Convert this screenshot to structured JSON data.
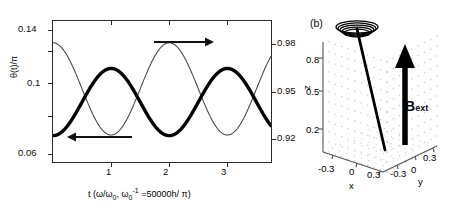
{
  "figure": {
    "panel_a_tag": "(a)",
    "panel_b_tag": "(b)"
  },
  "panel_a": {
    "ylabel_left": "θ(t)/π",
    "xlabel": "t (ω/ω₀, ω₀⁻¹ =50000h/ π)",
    "xlabel_main": "t (",
    "xlabel_w": "ω/ω",
    "xlabel_w_sub": "0",
    "xlabel_comma": ", ",
    "xlabel_w2": "ω",
    "xlabel_w2_sub": "0",
    "xlabel_w2_sup": "-1",
    "xlabel_tail": " =50000h/ π)",
    "annotation_cos": "cosθ(t)",
    "left_ticks": [
      "0.14",
      "0.1",
      "0.06"
    ],
    "right_ticks": [
      "0.98",
      "0.95",
      "0.92"
    ],
    "x_ticks": [
      "1",
      "2",
      "3"
    ],
    "arrow_left_name": "left-arrow-to-theta-axis",
    "arrow_right_name": "right-arrow-to-cos-axis"
  },
  "panel_b": {
    "xlabel": "x",
    "ylabel": "y",
    "zlabel": "z",
    "x_ticks": [
      "-0.3",
      "0",
      "0.3"
    ],
    "y_ticks": [
      "-0.3",
      "0",
      "0.3"
    ],
    "z_ticks": [
      "0.8",
      "0.5",
      "0.2"
    ],
    "field_label": "B",
    "field_sub": "ext"
  },
  "colors": {
    "axis": "#2b2b2b",
    "theta_curve": "#000000",
    "cos_curve": "#4a4a4a",
    "grid_dots": "#b9b9b9",
    "background": "#ffffff"
  },
  "chart_data": [
    {
      "type": "line",
      "title": "(a)",
      "xlabel": "t (ω/ω₀, ω₀⁻¹ =50000h/π)",
      "ylabel": "θ(t)/π",
      "ylabel_right": "cosθ(t)",
      "xlim": [
        0,
        3.75
      ],
      "ylim": [
        0.045,
        0.152
      ],
      "ylim_right": [
        0.9095,
        0.9905
      ],
      "xticks": [
        1,
        2,
        3
      ],
      "yticks": [
        0.14,
        0.1,
        0.06
      ],
      "yticks_right": [
        0.98,
        0.95,
        0.92
      ],
      "grid": false,
      "legend": "none",
      "annotations": [
        {
          "text": "cosθ(t)",
          "x": 1.55,
          "y": 0.144,
          "arrow": "right"
        },
        {
          "text": "",
          "x": 0.5,
          "y": 0.068,
          "arrow": "left"
        }
      ],
      "series": [
        {
          "name": "theta(t)/pi",
          "axis": "left",
          "linewidth": "thick",
          "color": "#000000",
          "period": 2.0,
          "amplitude": 0.0255,
          "offset": 0.0905,
          "phase_deg": -90,
          "x": [
            0.0,
            0.1,
            0.2,
            0.3,
            0.4,
            0.5,
            0.6,
            0.7,
            0.8,
            0.9,
            1.0,
            1.1,
            1.2,
            1.3,
            1.4,
            1.5,
            1.6,
            1.7,
            1.8,
            1.9,
            2.0,
            2.1,
            2.2,
            2.3,
            2.4,
            2.5,
            2.6,
            2.7,
            2.8,
            2.9,
            3.0,
            3.1,
            3.2,
            3.3,
            3.4,
            3.5,
            3.6,
            3.7,
            3.75
          ],
          "y": [
            0.0905,
            0.0945,
            0.0981,
            0.1011,
            0.1032,
            0.1043,
            0.1045,
            0.1037,
            0.1019,
            0.0993,
            0.096,
            0.0924,
            0.0886,
            0.085,
            0.0818,
            0.0793,
            0.0776,
            0.0768,
            0.077,
            0.0781,
            0.0801,
            0.0828,
            0.086,
            0.0894,
            0.0929,
            0.0961,
            0.099,
            0.1013,
            0.1031,
            0.1042,
            0.1045,
            0.1041,
            0.1029,
            0.101,
            0.0985,
            0.0955,
            0.0922,
            0.0887,
            0.087
          ]
        },
        {
          "name": "cos(theta(t))",
          "axis": "right",
          "linewidth": "thin",
          "color": "#4a4a4a",
          "period": 2.0,
          "amplitude": 0.0265,
          "offset": 0.9515,
          "phase_deg": 90,
          "x": [
            0.0,
            0.1,
            0.2,
            0.3,
            0.4,
            0.5,
            0.6,
            0.7,
            0.8,
            0.9,
            1.0,
            1.1,
            1.2,
            1.3,
            1.4,
            1.5,
            1.6,
            1.7,
            1.8,
            1.9,
            2.0,
            2.1,
            2.2,
            2.3,
            2.4,
            2.5,
            2.6,
            2.7,
            2.8,
            2.9,
            3.0,
            3.1,
            3.2,
            3.3,
            3.4,
            3.5,
            3.6,
            3.7,
            3.75
          ],
          "y": [
            0.96,
            0.956,
            0.952,
            0.9485,
            0.9458,
            0.944,
            0.9432,
            0.9437,
            0.9453,
            0.948,
            0.9515,
            0.9553,
            0.9592,
            0.963,
            0.9663,
            0.9688,
            0.9703,
            0.9708,
            0.9702,
            0.9686,
            0.9662,
            0.9632,
            0.9598,
            0.9563,
            0.953,
            0.95,
            0.9475,
            0.9456,
            0.9443,
            0.9436,
            0.9435,
            0.9443,
            0.9458,
            0.948,
            0.9508,
            0.954,
            0.9575,
            0.9612,
            0.963
          ]
        }
      ]
    },
    {
      "type": "scatter",
      "title": "(b)",
      "xlabel": "x",
      "ylabel": "y",
      "zlabel": "z",
      "xlim": [
        -0.45,
        0.45
      ],
      "ylim": [
        -0.45,
        0.45
      ],
      "zlim": [
        0.05,
        1.0
      ],
      "xticks": [
        -0.3,
        0,
        0.3
      ],
      "yticks": [
        -0.3,
        0,
        0.3
      ],
      "zticks": [
        0.2,
        0.5,
        0.8
      ],
      "grid": true,
      "legend": "none",
      "description": "3D precession trajectory: spin vector traces a spiral cone; B_ext vertical arrow along +z",
      "annotations": [
        {
          "text": "B_ext",
          "arrow": "up"
        }
      ]
    }
  ]
}
